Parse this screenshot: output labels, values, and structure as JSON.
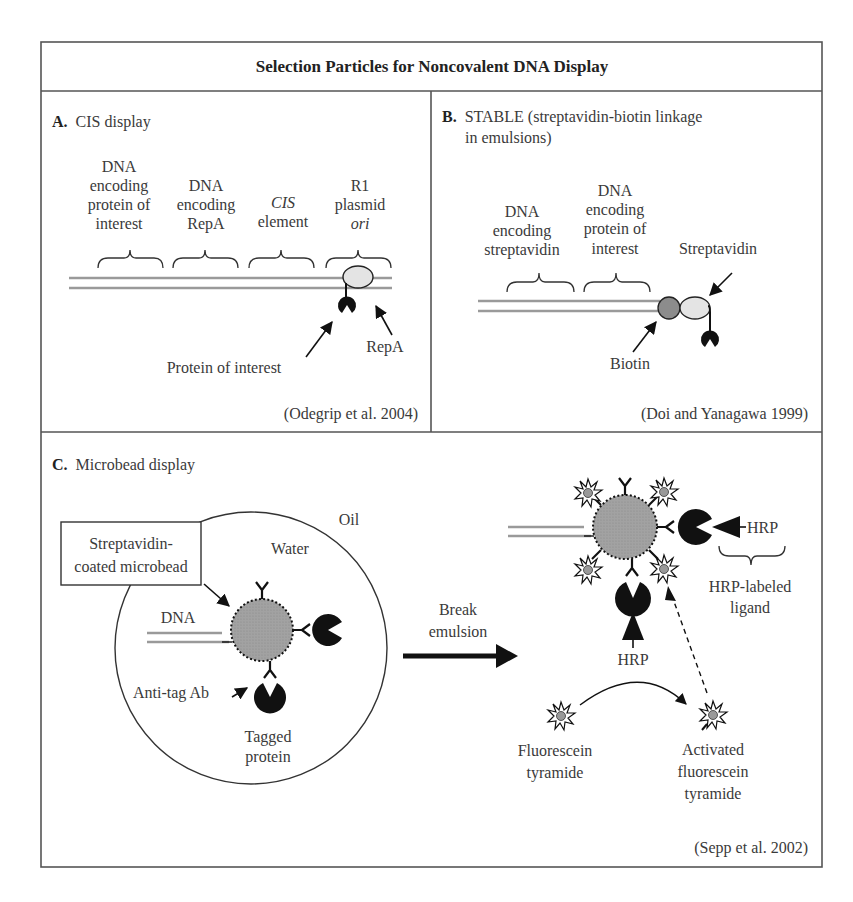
{
  "figure": {
    "title": "Selection Particles for Noncovalent DNA Display",
    "panels": {
      "A": {
        "letter": "A.",
        "heading": "CIS display",
        "segments": [
          {
            "lines": [
              "DNA",
              "encoding",
              "protein of",
              "interest"
            ]
          },
          {
            "lines": [
              "DNA",
              "encoding",
              "RepA"
            ]
          },
          {
            "lines": [
              "CIS",
              "element"
            ],
            "italic_first": true
          },
          {
            "lines": [
              "R1",
              "plasmid",
              "ori"
            ],
            "italic_last": true
          }
        ],
        "labels": {
          "protein_of_interest": "Protein of interest",
          "repa": "RepA"
        },
        "citation": "(Odegrip et al. 2004)"
      },
      "B": {
        "letter": "B.",
        "heading_line1": "STABLE (streptavidin-biotin linkage",
        "heading_line2": "in emulsions)",
        "segments": [
          {
            "lines": [
              "DNA",
              "encoding",
              "streptavidin"
            ]
          },
          {
            "lines": [
              "DNA",
              "encoding",
              "protein of",
              "interest"
            ]
          }
        ],
        "labels": {
          "streptavidin": "Streptavidin",
          "biotin": "Biotin"
        },
        "citation": "(Doi and Yanagawa 1999)"
      },
      "C": {
        "letter": "C.",
        "heading": "Microbead display",
        "labels": {
          "oil": "Oil",
          "water": "Water",
          "microbead_box": [
            "Streptavidin-",
            "coated microbead"
          ],
          "dna": "DNA",
          "anti_tag_ab": "Anti-tag Ab",
          "tagged_protein": [
            "Tagged",
            "protein"
          ],
          "break_emulsion": [
            "Break",
            "emulsion"
          ],
          "hrp_right": "HRP",
          "hrp_labeled_ligand": [
            "HRP-labeled",
            "ligand"
          ],
          "hrp_bottom": "HRP",
          "fluorescein_tyramide": [
            "Fluorescein",
            "tyramide"
          ],
          "activated_fluorescein_tyramide": [
            "Activated",
            "fluorescein",
            "tyramide"
          ]
        },
        "citation": "(Sepp et al. 2002)"
      }
    },
    "colors": {
      "frame": "#555555",
      "dna": "#9a9a9a",
      "bead": "#9c9c9c",
      "repa": "#e4e4e4",
      "biotin": "#8c8c8c",
      "protein": "#111111"
    }
  }
}
